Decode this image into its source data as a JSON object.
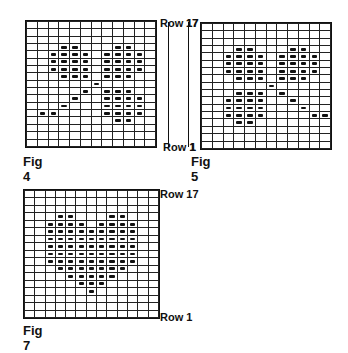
{
  "figures": [
    {
      "id": "fig4",
      "caption": "Fig 4",
      "top_label": "Row 17",
      "bottom_label": "Row 1",
      "cols": 12,
      "rows": 17,
      "stitches": [
        [],
        [],
        [],
        [
          3,
          4,
          8,
          9
        ],
        [
          2,
          3,
          4,
          5,
          7,
          8,
          9,
          10
        ],
        [
          2,
          3,
          4,
          5,
          7,
          8,
          9,
          10
        ],
        [
          2,
          3,
          4,
          5,
          7,
          8,
          9,
          10
        ],
        [
          3,
          4,
          5,
          7,
          8,
          9
        ],
        [
          6
        ],
        [
          5,
          7,
          8,
          9
        ],
        [
          4,
          7,
          8,
          9,
          10
        ],
        [
          3,
          7,
          8,
          9,
          10
        ],
        [
          1,
          2,
          7,
          8,
          9,
          10
        ],
        [
          8,
          9
        ],
        [],
        [],
        []
      ]
    },
    {
      "id": "fig5",
      "caption": "Fig 5",
      "top_label": "17",
      "bottom_label": "1",
      "cols": 12,
      "rows": 17,
      "stitches": [
        [],
        [],
        [],
        [
          3,
          4,
          8,
          9
        ],
        [
          2,
          3,
          4,
          5,
          7,
          8,
          9,
          10
        ],
        [
          2,
          3,
          4,
          5,
          7,
          8,
          9,
          10
        ],
        [
          2,
          3,
          4,
          5,
          7,
          8,
          9,
          10
        ],
        [
          3,
          4,
          5,
          7,
          8,
          9
        ],
        [
          6
        ],
        [
          3,
          4,
          5,
          7
        ],
        [
          2,
          3,
          4,
          5,
          8
        ],
        [
          2,
          3,
          4,
          5,
          9
        ],
        [
          2,
          3,
          4,
          5,
          10,
          11
        ],
        [
          3,
          4
        ],
        [],
        [],
        []
      ]
    },
    {
      "id": "fig7",
      "caption": "Fig 7",
      "top_label": "Row 17",
      "bottom_label": "Row 1",
      "cols": 13,
      "rows": 17,
      "stitches": [
        [],
        [],
        [],
        [
          3,
          4,
          8,
          9
        ],
        [
          2,
          3,
          4,
          5,
          7,
          8,
          9,
          10
        ],
        [
          2,
          3,
          4,
          5,
          6,
          7,
          8,
          9,
          10
        ],
        [
          2,
          3,
          4,
          5,
          6,
          7,
          8,
          9,
          10
        ],
        [
          2,
          3,
          4,
          5,
          6,
          7,
          8,
          9,
          10
        ],
        [
          2,
          3,
          4,
          5,
          6,
          7,
          8,
          9,
          10
        ],
        [
          2,
          3,
          4,
          5,
          6,
          7,
          8,
          9,
          10
        ],
        [
          3,
          4,
          5,
          6,
          7,
          8,
          9
        ],
        [
          4,
          5,
          6,
          7,
          8
        ],
        [
          5,
          6,
          7
        ],
        [
          6
        ],
        [],
        [],
        []
      ]
    }
  ]
}
